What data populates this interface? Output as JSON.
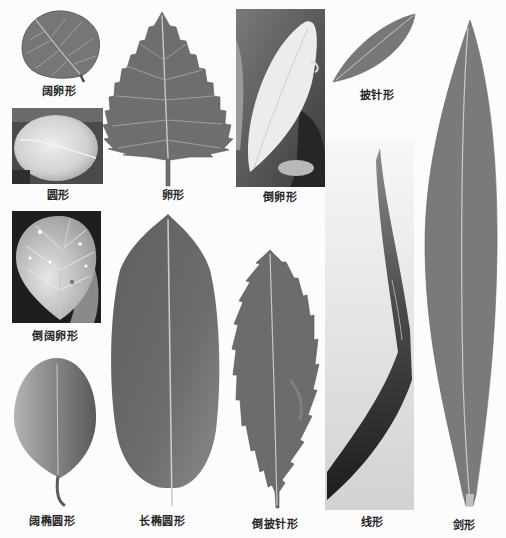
{
  "figure": {
    "panels": [
      {
        "key": "broad-ovate",
        "label": "阔卵形"
      },
      {
        "key": "orbicular",
        "label": "圆形"
      },
      {
        "key": "ovate",
        "label": "卵形"
      },
      {
        "key": "obovate",
        "label": "倒卵形"
      },
      {
        "key": "lanceolate",
        "label": "披针形"
      },
      {
        "key": "broad-obovate",
        "label": "倒阔卵形"
      },
      {
        "key": "broad-elliptic",
        "label": "阔椭圆形"
      },
      {
        "key": "oblong",
        "label": "长椭圆形"
      },
      {
        "key": "oblanceolate",
        "label": "倒披针形"
      },
      {
        "key": "linear",
        "label": "线形"
      },
      {
        "key": "ensiform",
        "label": "剑形"
      }
    ]
  },
  "colors": {
    "background": "#fcfcfc",
    "leaf_mid": "#6e6e6e",
    "leaf_dark": "#3a3a3a",
    "vein": "#c9c9c9",
    "caption": "#262626"
  }
}
